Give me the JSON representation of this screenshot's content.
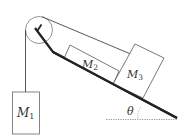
{
  "diagram": {
    "type": "physics-pulley-incline",
    "labels": {
      "m1_main": "M",
      "m1_sub": "1",
      "m2_main": "M",
      "m2_sub": "2",
      "m3_main": "M",
      "m3_sub": "3",
      "angle": "θ"
    },
    "colors": {
      "line": "#555555",
      "incline": "#222222",
      "text": "#333333",
      "dotted": "#777777"
    },
    "elements": [
      "pulley",
      "vertical-string",
      "incline-string",
      "incline-surface",
      "block-M1",
      "block-M2",
      "block-M3",
      "angle-theta",
      "horizontal-reference"
    ]
  }
}
